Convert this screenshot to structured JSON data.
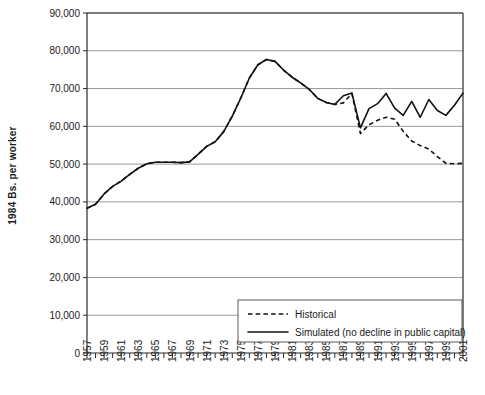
{
  "chart_data": {
    "type": "line",
    "title": "",
    "xlabel": "",
    "ylabel": "1984 Bs. per worker",
    "ylim": [
      0,
      90000
    ],
    "ytick_labels": [
      "90,000",
      "80,000",
      "70,000",
      "60,000",
      "50,000",
      "40,000",
      "30,000",
      "20,000",
      "10,000",
      "0"
    ],
    "ytick_values": [
      90000,
      80000,
      70000,
      60000,
      50000,
      40000,
      30000,
      20000,
      10000,
      0
    ],
    "xlim": [
      1957,
      2001
    ],
    "xtick_labels": [
      "1957",
      "1959",
      "1961",
      "1963",
      "1965",
      "1967",
      "1969",
      "1971",
      "1973",
      "1975",
      "1977",
      "1979",
      "1981",
      "1983",
      "1985",
      "1987",
      "1989",
      "1991",
      "1993",
      "1995",
      "1997",
      "1999",
      "2001"
    ],
    "grid": "horizontal",
    "legend_position": "bottom-right",
    "x": [
      1957,
      1958,
      1959,
      1960,
      1961,
      1962,
      1963,
      1964,
      1965,
      1966,
      1967,
      1968,
      1969,
      1970,
      1971,
      1972,
      1973,
      1974,
      1975,
      1976,
      1977,
      1978,
      1979,
      1980,
      1981,
      1982,
      1983,
      1984,
      1985,
      1986,
      1987,
      1988,
      1989,
      1990,
      1991,
      1992,
      1993,
      1994,
      1995,
      1996,
      1997,
      1998,
      1999,
      2000,
      2001
    ],
    "series": [
      {
        "name": "Historical",
        "style": "dashed",
        "values": [
          38300,
          39400,
          42100,
          44100,
          45500,
          47300,
          48900,
          50100,
          50500,
          50500,
          50500,
          50400,
          50600,
          52600,
          54700,
          55900,
          58600,
          62700,
          67500,
          72800,
          76300,
          77700,
          77200,
          74900,
          73000,
          71500,
          69800,
          67400,
          66300,
          65800,
          66200,
          68700,
          58100,
          60400,
          61600,
          62400,
          61900,
          58700,
          56100,
          54900,
          54000,
          52000,
          50200,
          50100,
          50200
        ]
      },
      {
        "name": "Simulated (no decline in public capital)",
        "style": "solid",
        "values": [
          38300,
          39400,
          42100,
          44100,
          45500,
          47300,
          48900,
          50100,
          50500,
          50500,
          50500,
          50400,
          50600,
          52600,
          54700,
          55900,
          58600,
          62700,
          67500,
          72800,
          76300,
          77700,
          77200,
          74900,
          73000,
          71500,
          69800,
          67400,
          66300,
          65800,
          68100,
          68800,
          59600,
          64700,
          66000,
          68700,
          64800,
          62900,
          66600,
          62400,
          67100,
          64200,
          62900,
          65600,
          68800
        ]
      }
    ],
    "legend": [
      {
        "label": "Historical",
        "style": "dashed"
      },
      {
        "label": "Simulated (no decline in public capital)",
        "style": "solid"
      }
    ]
  }
}
